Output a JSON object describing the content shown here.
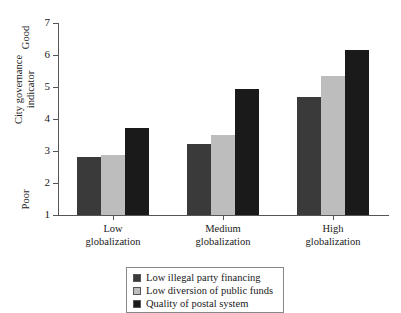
{
  "chart_data": {
    "type": "bar",
    "title": "",
    "subtitle": "",
    "xlabel": "",
    "ylabel": "City governance\nindicator",
    "ylim": [
      1,
      7
    ],
    "yticks": [
      1,
      2,
      3,
      4,
      5,
      6,
      7
    ],
    "ytick_labels": [
      "1",
      "2",
      "3",
      "4",
      "5",
      "6",
      "7"
    ],
    "grid": false,
    "legend_position": "bottom",
    "axis_anchor_high": "Good",
    "axis_anchor_low": "Poor",
    "categories": [
      "Low\nglobalization",
      "Medium\nglobalization",
      "High\nglobalization"
    ],
    "category_labels_flat": [
      "Low globalization",
      "Medium globalization",
      "High globalization"
    ],
    "series": [
      {
        "name": "Low illegal party financing",
        "color": "#3a3a3a",
        "values": [
          2.8,
          3.22,
          4.68
        ]
      },
      {
        "name": "Low diversion of public funds",
        "color": "#bdbdbd",
        "values": [
          2.88,
          3.5,
          5.35
        ]
      },
      {
        "name": "Quality of postal system",
        "color": "#1a1a1a",
        "values": [
          3.72,
          4.93,
          6.15
        ]
      }
    ]
  },
  "legend": {
    "items": [
      {
        "label": "Low illegal party financing",
        "color": "#3a3a3a"
      },
      {
        "label": "Low diversion of public funds",
        "color": "#bdbdbd"
      },
      {
        "label": "Quality of postal system",
        "color": "#1a1a1a"
      }
    ]
  },
  "colors": {
    "axis": "#555555",
    "text": "#1a1a1a",
    "background": "#ffffff",
    "series_1": "#3a3a3a",
    "series_2": "#bdbdbd",
    "series_3": "#1a1a1a"
  }
}
